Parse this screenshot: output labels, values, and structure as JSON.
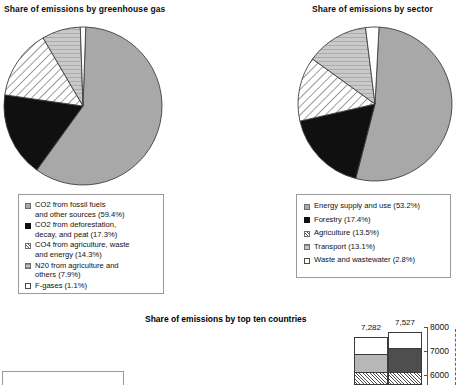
{
  "chart_data": [
    {
      "type": "pie",
      "title": "Share of emissions by greenhouse gas",
      "categories": [
        "CO2 from fossil fuels and other sources",
        "CO2 from deforestation, decay, and peat",
        "CO4 from agriculture, waste and energy",
        "N20 from agriculture and others",
        "F-gases"
      ],
      "values": [
        59.4,
        17.3,
        14.3,
        7.9,
        1.1
      ],
      "unit": "%",
      "legend_position": "below",
      "legend": [
        {
          "label": "CO2 from fossil fuels\nand other sources (59.4%)",
          "swatch": "gray"
        },
        {
          "label": "CO2 from deforestation,\ndecay, and peat (17.3%)",
          "swatch": "black"
        },
        {
          "label": "CO4 from agriculture, waste\nand energy (14.3%)",
          "swatch": "hatch"
        },
        {
          "label": "N20 from agriculture and\nothers (7.9%)",
          "swatch": "dot"
        },
        {
          "label": "F-gases (1.1%)",
          "swatch": "white"
        }
      ]
    },
    {
      "type": "pie",
      "title": "Share of emissions by sector",
      "categories": [
        "Energy supply and use",
        "Forestry",
        "Agriculture",
        "Transport",
        "Waste and wastewater"
      ],
      "values": [
        53.2,
        17.4,
        13.5,
        13.1,
        2.8
      ],
      "unit": "%",
      "legend_position": "below",
      "legend": [
        {
          "label": "Energy supply and use (53.2%)",
          "swatch": "gray"
        },
        {
          "label": "Forestry (17.4%)",
          "swatch": "black"
        },
        {
          "label": "Agriculture (13.5%)",
          "swatch": "hatch"
        },
        {
          "label": "Transport (13.1%)",
          "swatch": "dot"
        },
        {
          "label": "Waste and wastewater (2.8%)",
          "swatch": "white"
        }
      ]
    },
    {
      "type": "bar",
      "title": "Share of emissions by top ten countries",
      "categories": [
        "",
        ""
      ],
      "values": [
        7282,
        7527
      ],
      "value_labels": [
        "7,282",
        "7,527"
      ],
      "ylabel": "",
      "ylim": [
        5700,
        8100
      ],
      "yticks": [
        6000,
        7000,
        8000
      ],
      "ytick_labels": [
        "6000",
        "7000",
        "8000"
      ],
      "axis_side": "right",
      "grid": false,
      "note": "chart is cropped at the bottom edge of the image",
      "stacks": [
        {
          "value_label": "7,282",
          "segments": [
            "white",
            "lgray",
            "hatch"
          ]
        },
        {
          "value_label": "7,527",
          "segments": [
            "white",
            "dgray",
            "hatch"
          ]
        }
      ]
    }
  ],
  "pies": {
    "gas": {
      "title": "Share of emissions by greenhouse gas",
      "slices": [
        {
          "name": "co2-fossil",
          "pct": 59.4,
          "fill": "gray"
        },
        {
          "name": "co2-deforestation",
          "pct": 17.3,
          "fill": "black"
        },
        {
          "name": "co4-agriculture",
          "pct": 14.3,
          "fill": "hatch"
        },
        {
          "name": "n20-agriculture",
          "pct": 7.9,
          "fill": "dot"
        },
        {
          "name": "f-gases",
          "pct": 1.1,
          "fill": "white"
        }
      ]
    },
    "sector": {
      "title": "Share of emissions by sector",
      "slices": [
        {
          "name": "energy-supply-and-use",
          "pct": 53.2,
          "fill": "gray"
        },
        {
          "name": "forestry",
          "pct": 17.4,
          "fill": "black"
        },
        {
          "name": "agriculture",
          "pct": 13.5,
          "fill": "hatch"
        },
        {
          "name": "transport",
          "pct": 13.1,
          "fill": "dot"
        },
        {
          "name": "waste-and-wastewater",
          "pct": 2.8,
          "fill": "white"
        }
      ]
    }
  },
  "bar_section": {
    "title": "Share of emissions by top ten countries",
    "bars": [
      {
        "label": "7,282"
      },
      {
        "label": "7,527"
      }
    ],
    "axis": {
      "ticks": [
        "8000",
        "7000",
        "6000"
      ]
    }
  },
  "colors": {
    "gray": "#a8a8a8",
    "black": "#101010",
    "white": "#ffffff",
    "light_gray": "#b7b7b7",
    "dark_gray": "#4e4e4e",
    "outline": "#3a3a3a"
  }
}
